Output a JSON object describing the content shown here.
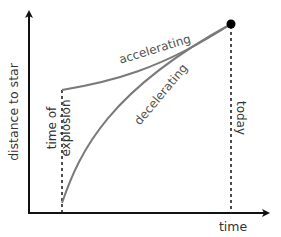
{
  "diagram": {
    "axes": {
      "y_label": "distance to star",
      "x_label": "time"
    },
    "markers": {
      "explosion_label_line1": "time of",
      "explosion_label_line2": "explosion",
      "today_label": "today"
    },
    "curves": {
      "accelerating_label": "accelerating",
      "decelerating_label": "decelerating"
    },
    "colors": {
      "axis": "#111111",
      "curve": "#7a7a7a",
      "label": "#555555",
      "dot": "#000000"
    }
  }
}
